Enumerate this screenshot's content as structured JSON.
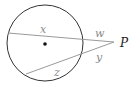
{
  "diagram": {
    "type": "circle-two-secants",
    "circle": {
      "cx": 45,
      "cy": 43,
      "r": 38,
      "stroke": "#333333"
    },
    "center_dot": {
      "cx": 45,
      "cy": 44,
      "r": 1.8,
      "fill": "#111111"
    },
    "external_point": {
      "label": "P",
      "x": 117,
      "y": 42
    },
    "secants": [
      {
        "from": [
          8,
          33
        ],
        "to": [
          114,
          42
        ],
        "stroke": "#9a9a9a"
      },
      {
        "from": [
          26,
          74
        ],
        "to": [
          114,
          42
        ],
        "stroke": "#9a9a9a"
      }
    ],
    "segment_labels": {
      "x": "x",
      "w": "w",
      "y": "y",
      "z": "z"
    }
  }
}
